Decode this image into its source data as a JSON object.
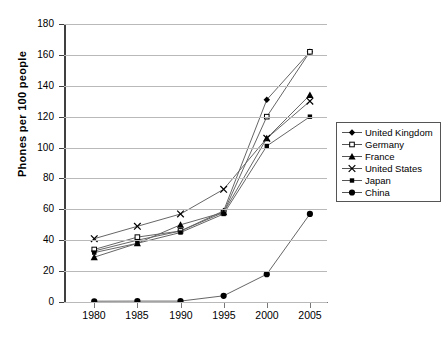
{
  "chart_data": {
    "type": "line",
    "title": "",
    "xlabel": "",
    "ylabel": "Phones  per  100  people",
    "categories": [
      "1980",
      "1985",
      "1990",
      "1995",
      "2000",
      "2005"
    ],
    "x": [
      1980,
      1985,
      1990,
      1995,
      2000,
      2005
    ],
    "ylim": [
      0,
      180
    ],
    "yticks": [
      "0",
      "20",
      "40",
      "60",
      "80",
      "100",
      "120",
      "140",
      "160",
      "180"
    ],
    "ytick_values": [
      0,
      20,
      40,
      60,
      80,
      100,
      120,
      140,
      160,
      180
    ],
    "grid": true,
    "legend_position": "right",
    "series": [
      {
        "name": "United Kingdom",
        "marker": "filled-diamond",
        "values": [
          33,
          40,
          46,
          59,
          131,
          162
        ]
      },
      {
        "name": "Germany",
        "marker": "open-square",
        "values": [
          34,
          42,
          46,
          58,
          120,
          162
        ]
      },
      {
        "name": "France",
        "marker": "filled-triangle",
        "values": [
          29,
          38,
          50,
          58,
          106,
          134
        ]
      },
      {
        "name": "United States",
        "marker": "cross-x",
        "values": [
          41,
          49,
          57,
          73,
          106,
          130
        ]
      },
      {
        "name": "Japan",
        "marker": "filled-square",
        "values": [
          32,
          38,
          45,
          57,
          101,
          120
        ]
      },
      {
        "name": "China",
        "marker": "filled-circle",
        "values": [
          0.5,
          0.6,
          0.6,
          4,
          18,
          57
        ]
      }
    ]
  },
  "legend": {
    "items": [
      {
        "label": "United Kingdom"
      },
      {
        "label": "Germany"
      },
      {
        "label": "France"
      },
      {
        "label": "United States"
      },
      {
        "label": "Japan"
      },
      {
        "label": "China"
      }
    ]
  },
  "axes": {
    "y_title": "Phones  per  100  people",
    "y_ticks": [
      "180",
      "160",
      "140",
      "120",
      "100",
      "80",
      "60",
      "40",
      "20",
      "0"
    ],
    "x_ticks": [
      "1980",
      "1985",
      "1990",
      "1995",
      "2000",
      "2005"
    ]
  }
}
